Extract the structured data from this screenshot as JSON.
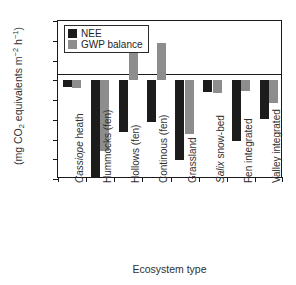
{
  "chart_data": {
    "type": "bar",
    "title": "",
    "xlabel": "Ecosystem type",
    "ylabel": "(mg CO2 equivalents m-2 h-1)",
    "ylabel_parts": {
      "prefix": "(mg CO",
      "sub1": "2",
      "mid": " equivalents m",
      "sup1": "−2",
      "mid2": " h",
      "sup2": "−1",
      "suffix": ")"
    },
    "categories": [
      "Cassiope heath",
      "Hummocks (fen)",
      "Hollows (fen)",
      "Continous (fen)",
      "Grassland",
      "Salix snow-bed",
      "Fen integrated",
      "Valley integrated"
    ],
    "categories_italic_prefix": [
      "Cassiope",
      "",
      "",
      "",
      "",
      "Salix",
      "",
      ""
    ],
    "series": [
      {
        "name": "NEE",
        "color": "#1c1c1c",
        "values": [
          -18,
          -245,
          -131,
          -105,
          -201,
          -30,
          -153,
          -97
        ]
      },
      {
        "name": "GWP balance",
        "color": "#8d8d8d",
        "values": [
          -20,
          -180,
          74,
          94,
          -136,
          -33,
          -28,
          -57
        ]
      }
    ],
    "ylim": [
      -250,
      150
    ],
    "yticks": [
      150,
      100,
      50,
      0,
      -50,
      -100,
      -150,
      -200,
      -250
    ],
    "ytick_labels": [
      "150",
      "100",
      "50",
      "0",
      "−50",
      "−100",
      "−150",
      "−200",
      "−250"
    ],
    "grid": false,
    "legend_position": "top-left",
    "zero_line": true
  }
}
